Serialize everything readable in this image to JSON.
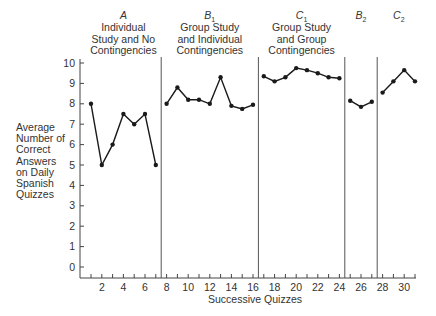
{
  "chart_data": {
    "type": "line",
    "title": "",
    "xlabel": "Successive Quizzes",
    "ylabel": "Average Number of Correct Answers on Daily Spanish Quizzes",
    "ylabel_lines": [
      "Average",
      "Number of",
      "Correct",
      "Answers",
      "on Daily",
      "Spanish",
      "Quizzes"
    ],
    "ylim": [
      0,
      10
    ],
    "yticks": [
      0,
      1,
      2,
      3,
      4,
      5,
      6,
      7,
      8,
      9,
      10
    ],
    "xlim": [
      0,
      32
    ],
    "xtick_labels": [
      2,
      4,
      6,
      8,
      10,
      12,
      14,
      16,
      18,
      20,
      22,
      24,
      26,
      28,
      30
    ],
    "grid": false,
    "phase_dividers": [
      7.5,
      16.5,
      24.5,
      27.5
    ],
    "phases": [
      {
        "id": "A",
        "letter": "A",
        "subscript": "",
        "lines": [
          "Individual",
          "Study and No",
          "Contingencies"
        ],
        "x": [
          1,
          2,
          3,
          4,
          5,
          6,
          7
        ],
        "values": [
          8.0,
          5.0,
          6.0,
          7.5,
          7.0,
          7.5,
          5.0
        ]
      },
      {
        "id": "B1",
        "letter": "B",
        "subscript": "1",
        "lines": [
          "Group Study",
          "and Individual",
          "Contingencies"
        ],
        "x": [
          8,
          9,
          10,
          11,
          12,
          13,
          14,
          15,
          16
        ],
        "values": [
          8.0,
          8.8,
          8.2,
          8.2,
          8.0,
          9.3,
          7.9,
          7.75,
          7.95
        ]
      },
      {
        "id": "C1",
        "letter": "C",
        "subscript": "1",
        "lines": [
          "Group Study",
          "and Group",
          "Contingencies"
        ],
        "x": [
          17,
          18,
          19,
          20,
          21,
          22,
          23,
          24
        ],
        "values": [
          9.35,
          9.1,
          9.3,
          9.75,
          9.65,
          9.5,
          9.3,
          9.25
        ]
      },
      {
        "id": "B2",
        "letter": "B",
        "subscript": "2",
        "lines": [],
        "x": [
          25,
          26,
          27
        ],
        "values": [
          8.15,
          7.85,
          8.1
        ]
      },
      {
        "id": "C2",
        "letter": "C",
        "subscript": "2",
        "lines": [],
        "x": [
          28,
          29,
          30,
          31
        ],
        "values": [
          8.55,
          9.1,
          9.65,
          9.1
        ]
      }
    ]
  },
  "layout": {
    "line_color": "#1a1a1a",
    "axis_color": "#444444",
    "divider_color": "#555555"
  }
}
